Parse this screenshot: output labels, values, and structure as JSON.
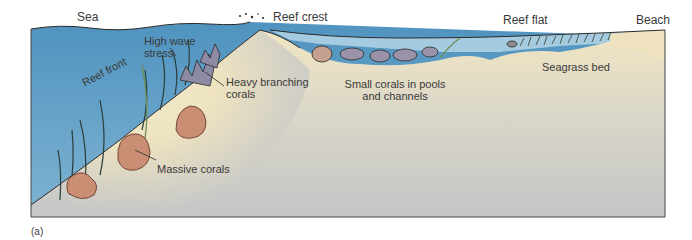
{
  "figure": {
    "panel_label": "(a)",
    "colors": {
      "sea": "#5a9cc4",
      "sea_light": "#a8cde0",
      "sand": "#f3e7c2",
      "deep_gray": "#c4c6c7",
      "coral_massive": "#c98e74",
      "coral_small": "#9a93a8",
      "outline": "#2a2a2a"
    }
  },
  "labels": {
    "sea": "Sea",
    "reef_crest": "Reef crest",
    "reef_flat": "Reef flat",
    "beach": "Beach",
    "high_wave_stress_1": "High wave",
    "high_wave_stress_2": "stress",
    "reef_front": "Reef front",
    "heavy_branching_1": "Heavy branching",
    "heavy_branching_2": "corals",
    "small_corals_1": "Small corals in pools",
    "small_corals_2": "and channels",
    "seagrass_bed": "Seagrass bed",
    "massive_corals": "Massive corals"
  }
}
